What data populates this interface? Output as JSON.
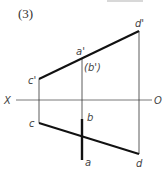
{
  "problem": {
    "number_label": "(3)"
  },
  "axis": {
    "left_label": "X",
    "right_label": "O"
  },
  "points": {
    "c_prime": "c'",
    "a_prime": "a'",
    "b_prime": "(b')",
    "d_prime": "d'",
    "c": "c",
    "b": "b",
    "a": "a",
    "d": "d"
  },
  "colors": {
    "line": "#111111",
    "thin_line": "#333333",
    "label": "#444444",
    "header_box": "#d8d8d8"
  }
}
